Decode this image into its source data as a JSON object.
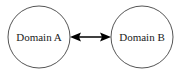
{
  "diagram": {
    "type": "node-link",
    "nodes": [
      {
        "id": "a",
        "label": "Domain A",
        "cx": 39,
        "cy": 37,
        "r": 31
      },
      {
        "id": "b",
        "label": "Domain B",
        "cx": 142,
        "cy": 37,
        "r": 31
      }
    ],
    "edges": [
      {
        "from": "a",
        "to": "b",
        "direction": "bidirectional"
      }
    ],
    "colors": {
      "stroke": "#555555",
      "arrow": "#000000",
      "text": "#222222",
      "background": "#ffffff"
    }
  }
}
